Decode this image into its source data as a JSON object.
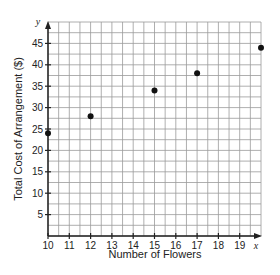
{
  "chart_data": {
    "type": "scatter",
    "title": "",
    "xlabel": "Number of Flowers",
    "ylabel": "Total Cost of Arrangement ($)",
    "x_axis_var": "x",
    "y_axis_var": "y",
    "xlim": [
      10,
      20
    ],
    "ylim": [
      0,
      50
    ],
    "x_ticks": [
      10,
      11,
      12,
      13,
      14,
      15,
      16,
      17,
      18,
      19
    ],
    "y_ticks": [
      5,
      10,
      15,
      20,
      25,
      30,
      35,
      40,
      45
    ],
    "grid": true,
    "grid_x_step": 0.5,
    "grid_y_step": 2.5,
    "points": [
      {
        "x": 10,
        "y": 24
      },
      {
        "x": 12,
        "y": 28
      },
      {
        "x": 15,
        "y": 34
      },
      {
        "x": 17,
        "y": 38
      },
      {
        "x": 20,
        "y": 44
      }
    ]
  },
  "colors": {
    "grid": "#9a9a9a",
    "axis": "#222222",
    "point": "#111111"
  }
}
